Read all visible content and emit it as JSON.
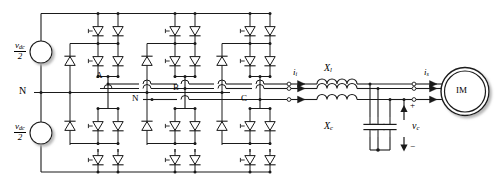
{
  "diagram": {
    "type": "power-electronics-schematic",
    "colors": {
      "wire": "#1a1a1a",
      "background": "#ffffff",
      "shadow": "#c8c8c8"
    }
  },
  "sources": {
    "upper": {
      "numerator": "v",
      "numerator_sub": "dc",
      "denominator": "2"
    },
    "lower": {
      "numerator": "v",
      "numerator_sub": "dc",
      "denominator": "2"
    }
  },
  "nodes": {
    "neutral_left": "N",
    "neutral_mid": "N",
    "phase_a": "A",
    "phase_b": "B",
    "phase_c": "C"
  },
  "filter": {
    "inductor_label": "X",
    "inductor_sub": "l",
    "capacitor_label": "X",
    "capacitor_sub": "c",
    "cap_voltage_label": "v",
    "cap_voltage_sub": "c",
    "polarity_plus": "+",
    "polarity_minus": "−"
  },
  "currents": {
    "inverter_current": "i",
    "inverter_current_sub": "i",
    "stator_current": "i",
    "stator_current_sub": "s"
  },
  "machine": {
    "label": "IM"
  },
  "counts": {
    "legs": 3,
    "switches_per_leg": 4,
    "clamp_diodes_per_leg": 2,
    "filter_inductors": 3,
    "filter_capacitors": 3
  }
}
